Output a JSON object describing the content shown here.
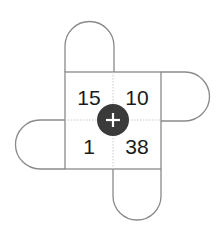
{
  "puzzle": {
    "operator": "+",
    "cells": {
      "top_left": "15",
      "top_right": "10",
      "bottom_left": "1",
      "bottom_right": "38"
    },
    "tabs": [
      "top",
      "right",
      "bottom",
      "left"
    ],
    "colors": {
      "outline": "#8a8a8a",
      "divider": "#c8c8c8",
      "operator_bg": "#3a3a3a",
      "operator_fg": "#ffffff",
      "text": "#1a1a1a"
    }
  }
}
